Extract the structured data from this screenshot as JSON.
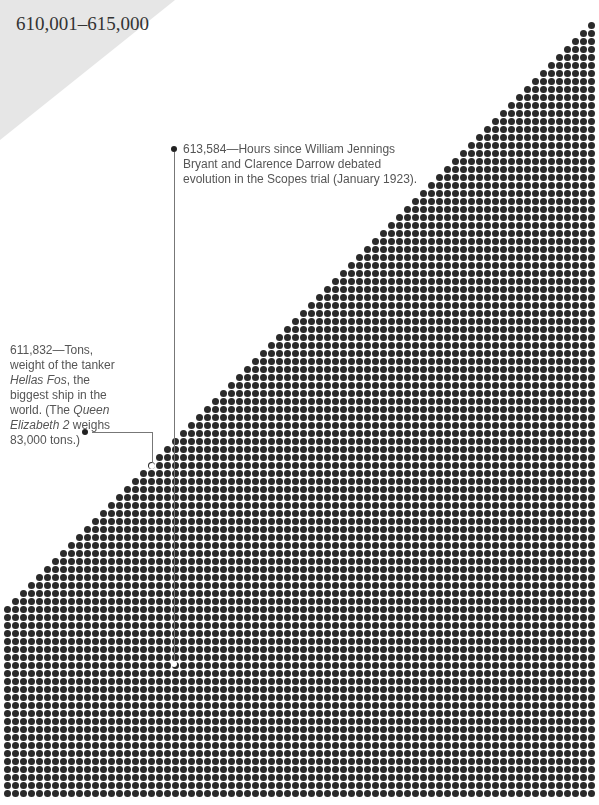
{
  "header": {
    "range_title": "610,001–615,000"
  },
  "annotations": [
    {
      "number": "613,584",
      "text": "Hours since William Jennings Bryant and Clarence Darrow debated evolution in the Scopes trial (January 1923).",
      "lines": [
        "613,584—Hours since William Jennings",
        "Bryant and Clarence Darrow debated",
        "evolution in the Scopes trial (January 1923)."
      ]
    },
    {
      "number": "611,832",
      "text": "Tons, weight of the tanker Hellas Fos, the biggest ship in the world. (The Queen Elizabeth 2 weighs 83,000 tons.)"
    }
  ],
  "ann2": {
    "l1": "611,832—Tons,",
    "l2": "weight of the tanker",
    "l3a": "Hellas Fos",
    "l3b": ", the",
    "l4": "biggest ship in the",
    "l5a": "world. (The ",
    "l5b": "Queen",
    "l6a": "Elizabeth 2",
    "l6b": " weighs",
    "l7": "83,000 tons.)"
  },
  "dot_grid": {
    "pitch": 8,
    "dot_diameter": 7,
    "color": "#2a2a2a",
    "left": 4,
    "right": 597,
    "top_right_y": 12,
    "bottom_left_top_y": 610,
    "bottom": 797
  }
}
